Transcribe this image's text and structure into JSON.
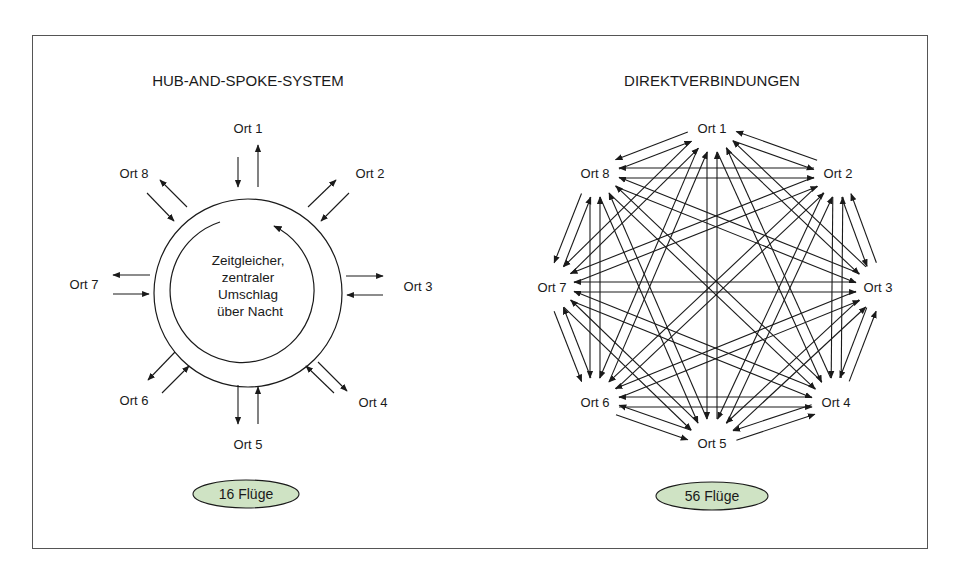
{
  "left_panel": {
    "title": "HUB-AND-SPOKE-SYSTEM",
    "nodes": [
      "Ort 1",
      "Ort 2",
      "Ort 3",
      "Ort 4",
      "Ort 5",
      "Ort 6",
      "Ort 7",
      "Ort 8"
    ],
    "hub_text": [
      "Zeitgleicher,",
      "zentraler",
      "Umschlag",
      "über Nacht"
    ],
    "badge": "16 Flüge"
  },
  "right_panel": {
    "title": "DIREKTVERBINDUNGEN",
    "nodes": [
      "Ort 1",
      "Ort 2",
      "Ort 3",
      "Ort 4",
      "Ort 5",
      "Ort 6",
      "Ort 7",
      "Ort 8"
    ],
    "badge": "56 Flüge"
  },
  "colors": {
    "badge_fill": "#cfe3c4",
    "line": "#1a1a1a",
    "frame": "#555555"
  }
}
